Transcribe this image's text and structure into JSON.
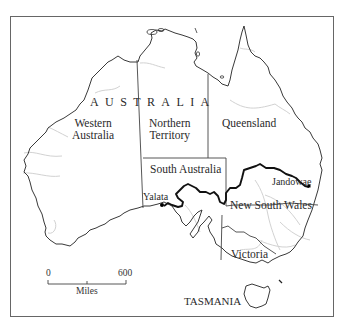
{
  "map": {
    "title": "AUSTRALIA",
    "regions": [
      {
        "id": "western-australia",
        "label": "Western Australia",
        "lines": [
          "Western",
          "Australia"
        ]
      },
      {
        "id": "northern-territory",
        "label": "Northern Territory",
        "lines": [
          "Northern",
          "Territory"
        ]
      },
      {
        "id": "queensland",
        "label": "Queensland",
        "lines": [
          "Queensland"
        ]
      },
      {
        "id": "south-australia",
        "label": "South Australia",
        "lines": [
          "South Australia"
        ]
      },
      {
        "id": "new-south-wales",
        "label": "New South Wales",
        "lines": [
          "New South Wales"
        ]
      },
      {
        "id": "victoria",
        "label": "Victoria",
        "lines": [
          "Victoria"
        ]
      },
      {
        "id": "tasmania",
        "label": "TASMANIA",
        "lines": [
          "TASMANIA"
        ]
      }
    ],
    "places": [
      {
        "id": "yalata",
        "label": "Yalata"
      },
      {
        "id": "jandowae",
        "label": "Jandowae"
      }
    ],
    "route": {
      "from": "Yalata",
      "to": "Jandowae",
      "style": "bold"
    },
    "scale": {
      "start": "0",
      "end": "600",
      "unit": "Miles"
    },
    "colors": {
      "coast": "#222222",
      "borders": "#444444",
      "route": "#111111",
      "rivers": "#cfcfcf",
      "frame": "#555555",
      "background": "#ffffff"
    }
  }
}
